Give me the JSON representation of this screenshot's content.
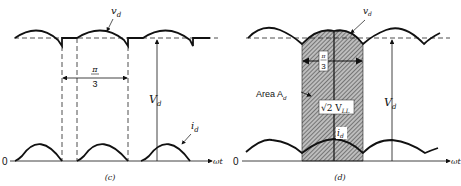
{
  "diagram": {
    "type": "waveform-comparison",
    "colors": {
      "ink": "#111111",
      "hatch": "#555555",
      "background": "#ffffff"
    },
    "panels": [
      {
        "id": "c",
        "caption": "(c)",
        "labels": {
          "voltage": "v",
          "voltage_sub": "d",
          "current": "i",
          "current_sub": "d",
          "avg": "V",
          "avg_sub": "d",
          "interval_num": "π",
          "interval_den": "3",
          "origin": "0",
          "axis": "ωt"
        }
      },
      {
        "id": "d",
        "caption": "(d)",
        "labels": {
          "voltage": "v",
          "voltage_sub": "d",
          "current": "i",
          "current_sub": "d",
          "avg": "V",
          "avg_sub": "d",
          "interval_num": "π",
          "interval_den": "3",
          "area": "Area A",
          "area_sub": "d",
          "peak": "√2 V",
          "peak_sub": "LL",
          "origin": "0",
          "axis": "ωt"
        }
      }
    ]
  }
}
